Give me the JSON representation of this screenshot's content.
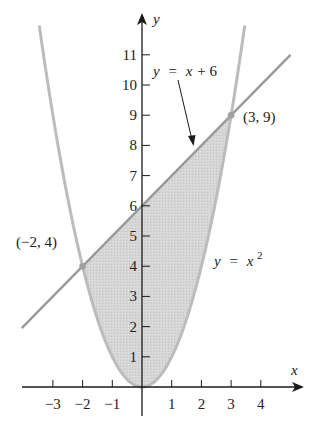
{
  "figure": {
    "type": "region between curves",
    "axes": {
      "x_label": "x",
      "y_label": "y",
      "x_ticks": [
        {
          "value": -3,
          "label": "−3"
        },
        {
          "value": -2,
          "label": "−2"
        },
        {
          "value": -1,
          "label": "−1"
        },
        {
          "value": 1,
          "label": "1"
        },
        {
          "value": 2,
          "label": "2"
        },
        {
          "value": 3,
          "label": "3"
        },
        {
          "value": 4,
          "label": "4"
        }
      ],
      "y_ticks": [
        {
          "value": 1,
          "label": "1"
        },
        {
          "value": 2,
          "label": "2"
        },
        {
          "value": 3,
          "label": "3"
        },
        {
          "value": 4,
          "label": "4"
        },
        {
          "value": 5,
          "label": "5"
        },
        {
          "value": 6,
          "label": "6"
        },
        {
          "value": 7,
          "label": "7"
        },
        {
          "value": 8,
          "label": "8"
        },
        {
          "value": 9,
          "label": "9"
        },
        {
          "value": 10,
          "label": "10"
        },
        {
          "value": 11,
          "label": "11"
        }
      ],
      "x_range": [
        -4,
        5.5
      ],
      "y_range": [
        -1,
        12.5
      ]
    },
    "curves": [
      {
        "name": "line",
        "equation_lhs": "y",
        "equation_eq": "=",
        "equation_rhs": "x + 6",
        "label": "y = x + 6",
        "color": "#9e9e9e"
      },
      {
        "name": "parabola",
        "equation_lhs": "y",
        "equation_eq": "=",
        "equation_base": "x",
        "equation_exp": "2",
        "label": "y = x²",
        "color": "#bdbdbd"
      }
    ],
    "intersection_points": [
      {
        "x": -2,
        "y": 4,
        "label": "(−2, 4)"
      },
      {
        "x": 3,
        "y": 9,
        "label": "(3, 9)"
      }
    ],
    "shaded_region": {
      "description": "region between y = x + 6 and y = x² from x = −2 to x = 3",
      "fill": "#d4d4d4"
    },
    "colors": {
      "axis": "#1a1a1a",
      "text": "#222222",
      "point": "#a0a0a0"
    }
  }
}
